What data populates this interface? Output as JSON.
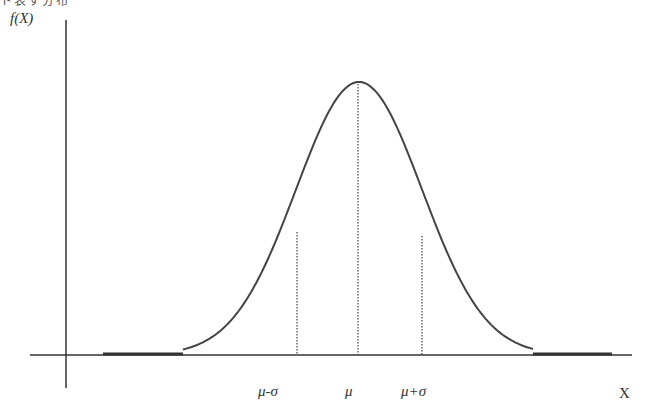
{
  "figure": {
    "top_cropped_text": "ト表す分布",
    "y_axis_label": "f(X)",
    "x_axis_label": "X",
    "tick_labels": [
      "μ-σ",
      "μ",
      "μ+σ"
    ],
    "line_color": "#444444",
    "background": "#ffffff"
  },
  "chart_data": {
    "type": "line",
    "title": "",
    "xlabel": "X",
    "ylabel": "f(X)",
    "curve": "normal-pdf",
    "mean_label": "μ",
    "sd_label": "σ",
    "markers": [
      {
        "label": "μ-σ",
        "x": -1,
        "style": "dotted-vertical"
      },
      {
        "label": "μ",
        "x": 0,
        "style": "dotted-vertical"
      },
      {
        "label": "μ+σ",
        "x": 1,
        "style": "dotted-vertical"
      }
    ],
    "x_range_sd": [
      -4.6,
      4.2
    ],
    "grid": false,
    "legend": null
  }
}
